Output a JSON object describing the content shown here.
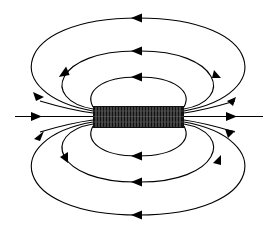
{
  "diagram": {
    "background": "#ffffff",
    "line_color": "#000000",
    "solenoid": {
      "x": 93,
      "y": 106,
      "width": 91,
      "height": 22,
      "turns": 30
    },
    "axis": {
      "x1": 15,
      "x2": 263,
      "y": 116.5,
      "arrows": [
        {
          "x": 38,
          "dir": "right"
        },
        {
          "x": 232,
          "dir": "right"
        }
      ]
    },
    "loops_top": [
      {
        "name": "inner",
        "rx": 52,
        "ry": 36,
        "top_arrow_dir": "left"
      },
      {
        "name": "middle",
        "rx": 80,
        "ry": 62,
        "top_arrow_dir": "left"
      },
      {
        "name": "outer",
        "rx": 120,
        "ry": 98,
        "top_arrow_dir": "left"
      }
    ],
    "loops_bottom": [
      {
        "name": "inner",
        "rx": 52,
        "ry": 36,
        "bottom_arrow_dir": "left"
      },
      {
        "name": "middle",
        "rx": 80,
        "ry": 62,
        "bottom_arrow_dir": "left"
      },
      {
        "name": "outer",
        "rx": 120,
        "ry": 98,
        "bottom_arrow_dir": "left"
      }
    ]
  }
}
